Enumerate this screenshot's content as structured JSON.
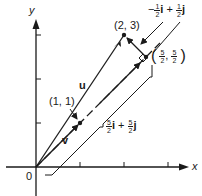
{
  "figure": {
    "axes": {
      "x_label": "x",
      "y_label": "y",
      "origin_label": "0"
    },
    "points": {
      "p23": "(2, 3)",
      "p11": "(1, 1)",
      "p_proj": {
        "open": "(",
        "num1": "5",
        "den1": "2",
        "sep": ",",
        "num2": "5",
        "den2": "2",
        "close": ")"
      }
    },
    "vectors": {
      "u": "u",
      "v": "v"
    },
    "annotations": {
      "perp": {
        "sign": "−",
        "num1": "1",
        "den1": "2",
        "i": "i",
        "plus": "+",
        "num2": "1",
        "den2": "2",
        "j": "j"
      },
      "proj": {
        "num1": "5",
        "den1": "2",
        "i": "i",
        "plus": "+",
        "num2": "5",
        "den2": "2",
        "j": "j"
      }
    },
    "colors": {
      "ink": "#1a1a1a",
      "background": "#ffffff"
    }
  }
}
